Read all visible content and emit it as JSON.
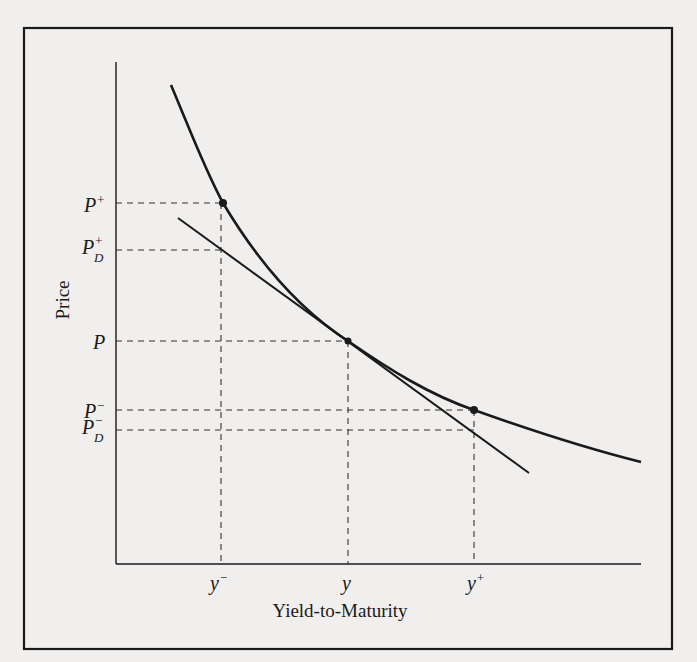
{
  "figure": {
    "type": "price-yield diagram",
    "y_axis_label": "Price",
    "x_axis_label": "Yield-to-Maturity",
    "price_labels": {
      "p_plus": {
        "base": "P",
        "sup": "+",
        "sub": ""
      },
      "p_d_plus": {
        "base": "P",
        "sup": "+",
        "sub": "D"
      },
      "p": {
        "base": "P",
        "sup": "",
        "sub": ""
      },
      "p_minus": {
        "base": "P",
        "sup": "−",
        "sub": ""
      },
      "p_d_minus": {
        "base": "P",
        "sup": "−",
        "sub": "D"
      }
    },
    "yield_labels": {
      "y_minus": {
        "base": "y",
        "sup": "−"
      },
      "y": {
        "base": "y",
        "sup": ""
      },
      "y_plus": {
        "base": "y",
        "sup": "+"
      }
    },
    "curves": [
      {
        "name": "price-yield curve (convex)",
        "points": [
          [
            171,
            85
          ],
          [
            223,
            203
          ],
          [
            348,
            341
          ],
          [
            474,
            410
          ],
          [
            641,
            462
          ]
        ]
      },
      {
        "name": "duration tangent line",
        "points": [
          [
            178,
            218
          ],
          [
            529,
            473
          ]
        ]
      }
    ],
    "colors": {
      "ink": "#1a1a1a",
      "background": "#f0efed"
    }
  }
}
